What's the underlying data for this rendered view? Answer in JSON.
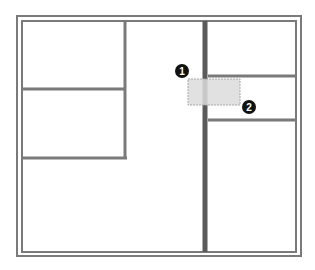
{
  "canvas": {
    "width": 315,
    "height": 270,
    "background": "#ffffff"
  },
  "colors": {
    "wall": "#7a7a7a",
    "wall_dark": "#5a5a5a",
    "selection_fill": "#dcdcdc",
    "selection_stroke": "#a8a8a8",
    "marker_fill": "#111111",
    "marker_text": "#ffffff"
  },
  "floor_plan": {
    "outer_wall": {
      "x": 17,
      "y": 16,
      "w": 284,
      "h": 240
    },
    "inner_wall": {
      "x": 22,
      "y": 21,
      "w": 274,
      "h": 231
    },
    "interior_walls": [
      {
        "name": "left-vertical-wall",
        "x1": 125,
        "y1": 21,
        "x2": 125,
        "y2": 159
      },
      {
        "name": "left-upper-horizontal-wall",
        "x1": 22,
        "y1": 89,
        "x2": 125,
        "y2": 89
      },
      {
        "name": "left-lower-horizontal-wall",
        "x1": 22,
        "y1": 158,
        "x2": 127,
        "y2": 158
      },
      {
        "name": "center-vertical-wall",
        "x1": 205,
        "y1": 21,
        "x2": 205,
        "y2": 252
      },
      {
        "name": "right-upper-horizontal-wall",
        "x1": 208,
        "y1": 76,
        "x2": 296,
        "y2": 76
      },
      {
        "name": "right-lower-horizontal-wall",
        "x1": 208,
        "y1": 120,
        "x2": 296,
        "y2": 120
      }
    ]
  },
  "selection": {
    "x": 188,
    "y": 79,
    "w": 52,
    "h": 26
  },
  "markers": [
    {
      "label": "1",
      "cx": 182,
      "cy": 71
    },
    {
      "label": "2",
      "cx": 249,
      "cy": 107
    }
  ]
}
